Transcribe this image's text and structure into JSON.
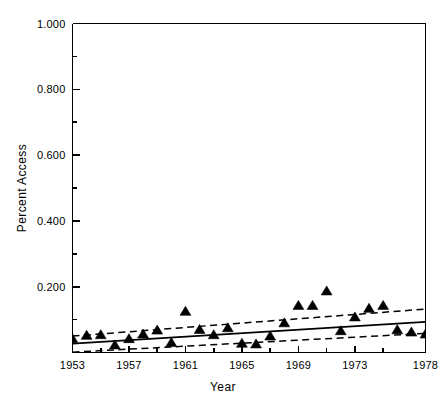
{
  "chart_data": {
    "type": "scatter",
    "title": "",
    "subtitle": "",
    "xlabel": "Year",
    "ylabel": "Percent Access",
    "xlim": [
      1953,
      1978
    ],
    "ylim": [
      0.0,
      1.0
    ],
    "grid": false,
    "legend": null,
    "legend_position": "none",
    "marker": "filled-triangle",
    "marker_color": "#000000",
    "line_color": "#000000",
    "x_ticks_major": [
      1953,
      1957,
      1961,
      1965,
      1969,
      1973,
      1978
    ],
    "x_tick_labels": [
      "1953",
      "1957",
      "1961",
      "1965",
      "1969",
      "1973",
      "1978"
    ],
    "x_ticks_minor": [
      1955,
      1959,
      1963,
      1967,
      1971,
      1975
    ],
    "y_ticks_major": [
      0.2,
      0.4,
      0.6,
      0.8,
      1.0
    ],
    "y_tick_labels": [
      "0.200",
      "0.400",
      "0.600",
      "0.800",
      "1.000"
    ],
    "y_ticks_minor": [
      0.1,
      0.3,
      0.5,
      0.7,
      0.9
    ],
    "x": [
      1953,
      1954,
      1955,
      1956,
      1957,
      1958,
      1959,
      1960,
      1961,
      1962,
      1963,
      1964,
      1965,
      1966,
      1967,
      1968,
      1969,
      1970,
      1971,
      1972,
      1973,
      1974,
      1975,
      1976,
      1977,
      1978
    ],
    "values": [
      0.03,
      0.04,
      0.042,
      0.011,
      0.03,
      0.044,
      0.056,
      0.018,
      0.113,
      0.058,
      0.042,
      0.063,
      0.016,
      0.014,
      0.038,
      0.078,
      0.131,
      0.131,
      0.175,
      0.054,
      0.096,
      0.122,
      0.131,
      0.057,
      0.05,
      0.044
    ],
    "fit_line": {
      "name": "regression fit",
      "style": "solid",
      "x": [
        1953,
        1978
      ],
      "y": [
        0.027,
        0.093
      ]
    },
    "confidence_bands": [
      {
        "name": "upper confidence band",
        "style": "dashed",
        "x": [
          1953,
          1978
        ],
        "y": [
          0.05,
          0.132
        ]
      },
      {
        "name": "lower confidence band",
        "style": "dashed",
        "x": [
          1953,
          1978
        ],
        "y": [
          0.001,
          0.058
        ]
      }
    ]
  }
}
